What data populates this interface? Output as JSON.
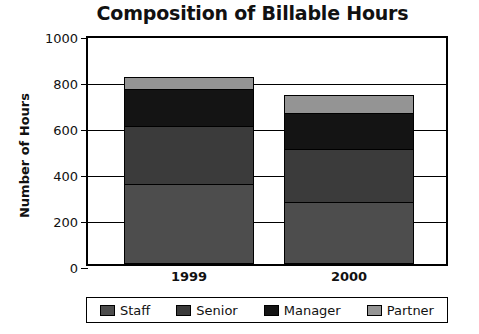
{
  "chart_data": {
    "type": "bar",
    "stacked": true,
    "title": "Composition of Billable Hours",
    "xlabel": "",
    "ylabel": "Number of Hours",
    "categories": [
      "1999",
      "2000"
    ],
    "ylim": [
      0,
      1000
    ],
    "yticks": [
      0,
      200,
      400,
      600,
      800,
      1000
    ],
    "ytick_labels": [
      "0",
      "200",
      "400",
      "600",
      "800",
      "1000"
    ],
    "grid": true,
    "legend_position": "bottom",
    "series": [
      {
        "name": "Staff",
        "values": [
          350,
          270
        ],
        "color": "#4d4d4d"
      },
      {
        "name": "Senior",
        "values": [
          250,
          230
        ],
        "color": "#3b3b3b"
      },
      {
        "name": "Manager",
        "values": [
          160,
          155
        ],
        "color": "#141414"
      },
      {
        "name": "Partner",
        "values": [
          55,
          80
        ],
        "color": "#949494"
      }
    ],
    "totals": [
      815,
      735
    ]
  }
}
